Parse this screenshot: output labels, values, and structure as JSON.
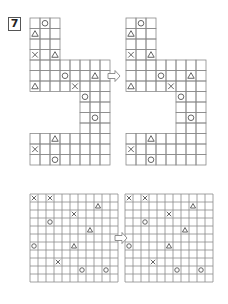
{
  "puzzle_number": "7",
  "colors": {
    "grid": "#8a8a8a",
    "mark": "#555555"
  },
  "top": {
    "cell": 10,
    "left_origin": [
      30,
      18
    ],
    "right_origin": [
      126,
      18
    ],
    "arrow": [
      108,
      76
    ],
    "row_spans": [
      [
        0,
        3
      ],
      [
        0,
        3
      ],
      [
        0,
        3
      ],
      [
        0,
        3
      ],
      [
        0,
        8
      ],
      [
        0,
        8
      ],
      [
        0,
        8
      ],
      [
        5,
        8
      ],
      [
        5,
        8
      ],
      [
        5,
        8
      ],
      [
        5,
        8
      ],
      [
        0,
        8
      ],
      [
        0,
        8
      ],
      [
        0,
        8
      ]
    ],
    "cell_h": 10.5,
    "marks": [
      {
        "c": 1,
        "r": 0,
        "s": "O"
      },
      {
        "c": 0,
        "r": 1,
        "s": "T"
      },
      {
        "c": 0,
        "r": 3,
        "s": "X"
      },
      {
        "c": 2,
        "r": 3,
        "s": "T"
      },
      {
        "c": 3,
        "r": 5,
        "s": "O"
      },
      {
        "c": 6,
        "r": 5,
        "s": "T"
      },
      {
        "c": 0,
        "r": 6,
        "s": "T"
      },
      {
        "c": 4,
        "r": 6,
        "s": "X"
      },
      {
        "c": 5,
        "r": 7,
        "s": "O"
      },
      {
        "c": 6,
        "r": 9,
        "s": "O"
      },
      {
        "c": 2,
        "r": 11,
        "s": "T"
      },
      {
        "c": 0,
        "r": 12,
        "s": "X"
      },
      {
        "c": 2,
        "r": 13,
        "s": "O"
      }
    ]
  },
  "bottom": {
    "cell": 8,
    "cols": 11,
    "rows": 11,
    "left_origin": [
      30,
      194
    ],
    "right_origin": [
      125,
      194
    ],
    "arrow": [
      115,
      238
    ],
    "marks": [
      {
        "c": 0,
        "r": 0,
        "s": "X"
      },
      {
        "c": 2,
        "r": 0,
        "s": "X"
      },
      {
        "c": 8,
        "r": 1,
        "s": "T"
      },
      {
        "c": 5,
        "r": 2,
        "s": "X"
      },
      {
        "c": 2,
        "r": 3,
        "s": "O"
      },
      {
        "c": 7,
        "r": 4,
        "s": "T"
      },
      {
        "c": 0,
        "r": 6,
        "s": "O"
      },
      {
        "c": 5,
        "r": 6,
        "s": "T"
      },
      {
        "c": 3,
        "r": 8,
        "s": "X"
      },
      {
        "c": 6,
        "r": 9,
        "s": "O"
      },
      {
        "c": 9,
        "r": 9,
        "s": "O"
      }
    ]
  }
}
